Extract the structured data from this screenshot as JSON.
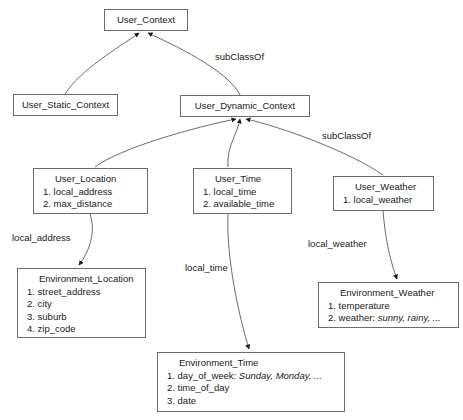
{
  "diagram": {
    "stroke_color": "#6b6b6b",
    "text_color": "#1a1a1a",
    "background": "#ffffff"
  },
  "nodes": {
    "user_context": {
      "title": "User_Context"
    },
    "user_static_context": {
      "title": "User_Static_Context"
    },
    "user_dynamic_context": {
      "title": "User_Dynamic_Context"
    },
    "user_location": {
      "title": "User_Location",
      "attrs": [
        {
          "num": "1.",
          "name": "local_address",
          "val": ""
        },
        {
          "num": "2.",
          "name": "max_distance",
          "val": ""
        }
      ]
    },
    "user_time": {
      "title": "User_Time",
      "attrs": [
        {
          "num": "1.",
          "name": "local_time",
          "val": ""
        },
        {
          "num": "2.",
          "name": "available_time",
          "val": ""
        }
      ]
    },
    "user_weather": {
      "title": "User_Weather",
      "attrs": [
        {
          "num": "1.",
          "name": "local_weather",
          "val": ""
        }
      ]
    },
    "environment_location": {
      "title": "Environment_Location",
      "attrs": [
        {
          "num": "1.",
          "name": "street_address",
          "val": ""
        },
        {
          "num": "2.",
          "name": "city",
          "val": ""
        },
        {
          "num": "3.",
          "name": "suburb",
          "val": ""
        },
        {
          "num": "4.",
          "name": "zip_code",
          "val": ""
        }
      ]
    },
    "environment_time": {
      "title": "Environment_Time",
      "attrs": [
        {
          "num": "1.",
          "name": "day_of_week:",
          "val": "Sunday, Monday, ..."
        },
        {
          "num": "2.",
          "name": "time_of_day",
          "val": ""
        },
        {
          "num": "3.",
          "name": "date",
          "val": ""
        }
      ]
    },
    "environment_weather": {
      "title": "Environment_Weather",
      "attrs": [
        {
          "num": "1.",
          "name": "temperature",
          "val": ""
        },
        {
          "num": "2.",
          "name": "weather:",
          "val": "sunny, rainy, ..."
        }
      ]
    }
  },
  "edge_labels": {
    "subclassof_top": "subClassOf",
    "subclassof_mid": "subClassOf",
    "local_address": "local_address",
    "local_time": "local_time",
    "local_weather": "local_weather"
  }
}
